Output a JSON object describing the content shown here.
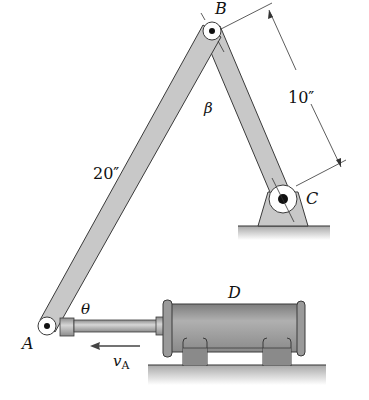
{
  "figure": {
    "type": "mechanism-diagram"
  },
  "points": {
    "A": {
      "label": "A",
      "x": 47,
      "y": 326
    },
    "B": {
      "label": "B",
      "x": 212,
      "y": 31
    },
    "C": {
      "label": "C",
      "x": 283,
      "y": 199
    }
  },
  "labels": {
    "point_a": "A",
    "point_b": "B",
    "point_c": "C",
    "cylinder_d": "D",
    "angle_theta": "θ",
    "angle_beta": "β",
    "velocity": "v",
    "velocity_sub": "A"
  },
  "dimensions": {
    "link_ab": "20″",
    "link_bc": "10″"
  },
  "colors": {
    "link_fill": "#c8c8c8",
    "link_stroke": "#3a3a3a",
    "cylinder_fill": "#9a9a9a",
    "ground_fill": "#b8b8b8",
    "line": "#333333"
  }
}
